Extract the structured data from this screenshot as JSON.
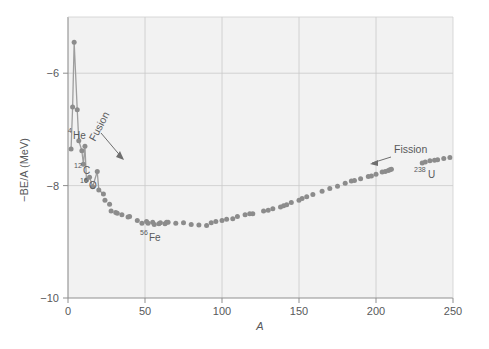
{
  "figure": {
    "background": "#ffffff",
    "plot_background": "#f2f2f2",
    "frame_color": "#9a9a9a",
    "grid_color": "#c9c9c9",
    "marker_color": "#8c8c8c",
    "line_color": "#9e9e9e",
    "text_color": "#58595b"
  },
  "chart_data": {
    "type": "scatter",
    "title": "",
    "xlabel": "A",
    "ylabel": "−BE/A (MeV)",
    "xlim": [
      0,
      250
    ],
    "ylim": [
      -10,
      -5.0
    ],
    "xticks": [
      0,
      50,
      100,
      150,
      200,
      250
    ],
    "xticklabels": [
      "0",
      "50",
      "100",
      "150",
      "200",
      "250"
    ],
    "yticks": [
      -6,
      -8,
      -10
    ],
    "yticklabels": [
      "−6",
      "−8",
      "−10"
    ],
    "grid": true,
    "grid_axes": "both",
    "legend": null,
    "series": [
      {
        "name": "−BE/A vs A (light nuclei, connected)",
        "connected": true,
        "x": [
          2,
          3,
          4,
          6,
          7,
          9,
          10,
          11,
          12,
          14,
          16,
          19,
          20,
          23
        ],
        "y": [
          -7.35,
          -6.6,
          -5.45,
          -6.65,
          -7.2,
          -7.38,
          -7.62,
          -7.3,
          -7.9,
          -7.85,
          -8.02,
          -7.75,
          -8.08,
          -8.15
        ]
      },
      {
        "name": "−BE/A vs A (A ≥ 24, markers only)",
        "connected": false,
        "x": [
          24,
          27,
          28,
          31,
          32,
          35,
          39,
          40,
          45,
          48,
          51,
          52,
          55,
          56,
          59,
          60,
          63,
          64,
          65,
          70,
          75,
          80,
          85,
          90,
          93,
          96,
          100,
          103,
          107,
          110,
          115,
          118,
          120,
          127,
          130,
          133,
          138,
          140,
          142,
          145,
          150,
          152,
          155,
          159,
          165,
          170,
          175,
          180,
          184,
          186,
          190,
          195,
          197,
          200,
          204,
          206,
          208,
          209,
          210,
          230,
          232,
          235,
          238,
          240,
          244,
          248
        ],
        "y": [
          -8.26,
          -8.33,
          -8.45,
          -8.48,
          -8.49,
          -8.52,
          -8.56,
          -8.55,
          -8.62,
          -8.67,
          -8.64,
          -8.67,
          -8.65,
          -8.69,
          -8.68,
          -8.66,
          -8.68,
          -8.65,
          -8.65,
          -8.67,
          -8.66,
          -8.69,
          -8.7,
          -8.71,
          -8.66,
          -8.64,
          -8.62,
          -8.6,
          -8.59,
          -8.55,
          -8.52,
          -8.5,
          -8.5,
          -8.45,
          -8.44,
          -8.41,
          -8.38,
          -8.36,
          -8.34,
          -8.3,
          -8.26,
          -8.23,
          -8.2,
          -8.16,
          -8.1,
          -8.05,
          -8.01,
          -7.96,
          -7.92,
          -7.91,
          -7.88,
          -7.84,
          -7.83,
          -7.8,
          -7.76,
          -7.75,
          -7.73,
          -7.72,
          -7.71,
          -7.6,
          -7.58,
          -7.56,
          -7.55,
          -7.54,
          -7.52,
          -7.5
        ]
      }
    ],
    "annotations": [
      {
        "name": "fusion",
        "text": "Fusion",
        "rotated": true,
        "has_arrow": true,
        "arrow_direction": "down-right"
      },
      {
        "name": "fission",
        "text": "Fission",
        "rotated": false,
        "has_arrow": true,
        "arrow_direction": "left"
      },
      {
        "name": "he4",
        "base": "He",
        "mass": "4",
        "text": "⁴He"
      },
      {
        "name": "c12",
        "base": "C",
        "mass": "12",
        "text": "¹²C"
      },
      {
        "name": "o16",
        "base": "O",
        "mass": "16",
        "text": "¹⁶O"
      },
      {
        "name": "fe56",
        "base": "Fe",
        "mass": "56",
        "text": "⁵⁶Fe"
      },
      {
        "name": "u238",
        "base": "U",
        "mass": "238",
        "text": "²³⁸U"
      }
    ]
  }
}
